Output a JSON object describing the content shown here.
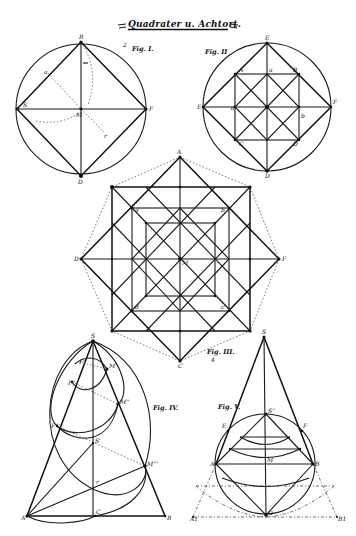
{
  "title": "Quadrater u. Achtort.",
  "figures": {
    "fig1": {
      "label": "Fig. I.",
      "marker": "2",
      "points": {
        "top": "B",
        "right": "F",
        "left": "S",
        "center": "M",
        "bottom": "D",
        "mid_left_edge": "a",
        "radius": "r"
      }
    },
    "fig2": {
      "label": "Fig. II",
      "points": {
        "top": "E",
        "left": "E",
        "right": "F",
        "bottom": "D",
        "sq_tl": "A",
        "sq_tr": "B",
        "sq_bl": "C",
        "sq_br": "D",
        "center": "M",
        "mid_top": "a",
        "mid_left": "d",
        "mid_right": "b",
        "mid_bottom": "c"
      }
    },
    "fig3": {
      "label": "Fig. III.",
      "sublabel": "4",
      "points": {
        "top": "A",
        "left": "D",
        "right": "F",
        "bottom": "C",
        "sq_tl": "E",
        "sq_tr": "B",
        "sq_bl": "G",
        "sq_br": "H",
        "center": "M",
        "inner_tl": "a",
        "inner_tr": "b",
        "inner_bl": "d",
        "inner_br": "c"
      }
    },
    "fig4": {
      "label": "Fig. IV.",
      "points": {
        "apex": "S",
        "base_left": "A",
        "base_right": "B",
        "base_mid": "C",
        "left_1": "F'",
        "left_2": "F''",
        "left_3": "F'''",
        "right_1": "M'",
        "right_2": "M''",
        "right_3": "M'''",
        "axis_mid": "S'",
        "radius": "r"
      }
    },
    "fig5": {
      "label": "Fig. V.",
      "points": {
        "apex": "S",
        "circle_top": "S''",
        "left": "A",
        "right": "B",
        "upper_left": "E",
        "upper_right": "F",
        "center": "M",
        "bottom": "D",
        "ext_left": "A1",
        "ext_right": "B1"
      }
    }
  }
}
